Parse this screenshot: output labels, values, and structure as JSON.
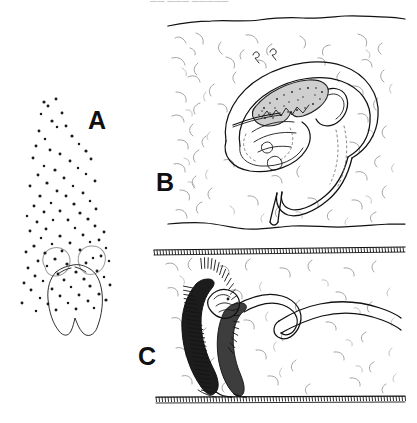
{
  "figure": {
    "type": "scientific-line-drawing",
    "background_color": "#ffffff",
    "ink_color": "#111111",
    "texture_color": "#8d8d8d",
    "width": 417,
    "height": 423,
    "top_caption_truncated": "—— ——— —————"
  },
  "panels": [
    {
      "id": "A",
      "label": "A",
      "label_x": 88,
      "label_y": 108,
      "description": "Stippled outline of a lobed body with a rising plume of scattered dots",
      "has_border": false,
      "dot_count": 78
    },
    {
      "id": "B",
      "label": "B",
      "label_x": 156,
      "label_y": 170,
      "description": "Coiled worm-like organism within textured soil cross-section, stippled internal organ",
      "has_border": false,
      "bounds": {
        "x": 167,
        "y": 16,
        "w": 238,
        "h": 212
      }
    },
    {
      "id": "C",
      "label": "C",
      "label_x": 138,
      "label_y": 344,
      "description": "Darkly shaded organism in a chamber bounded by hatched surfaces top and bottom",
      "has_border": false,
      "bounds": {
        "x": 153,
        "y": 243,
        "w": 252,
        "h": 160
      }
    }
  ],
  "panel_a_dots": [
    [
      44,
      102
    ],
    [
      48,
      106
    ],
    [
      56,
      99
    ],
    [
      41,
      114
    ],
    [
      62,
      113
    ],
    [
      52,
      121
    ],
    [
      57,
      127
    ],
    [
      39,
      131
    ],
    [
      66,
      126
    ],
    [
      45,
      139
    ],
    [
      72,
      136
    ],
    [
      36,
      146
    ],
    [
      79,
      144
    ],
    [
      50,
      150
    ],
    [
      60,
      154
    ],
    [
      86,
      151
    ],
    [
      33,
      158
    ],
    [
      70,
      161
    ],
    [
      44,
      166
    ],
    [
      91,
      159
    ],
    [
      55,
      170
    ],
    [
      78,
      168
    ],
    [
      38,
      175
    ],
    [
      64,
      178
    ],
    [
      86,
      174
    ],
    [
      47,
      183
    ],
    [
      30,
      186
    ],
    [
      73,
      186
    ],
    [
      95,
      181
    ],
    [
      57,
      191
    ],
    [
      40,
      196
    ],
    [
      66,
      196
    ],
    [
      83,
      193
    ],
    [
      51,
      203
    ],
    [
      34,
      206
    ],
    [
      74,
      204
    ],
    [
      90,
      201
    ],
    [
      44,
      212
    ],
    [
      60,
      211
    ],
    [
      27,
      216
    ],
    [
      80,
      213
    ],
    [
      96,
      209
    ],
    [
      53,
      220
    ],
    [
      37,
      222
    ],
    [
      68,
      220
    ],
    [
      88,
      219
    ],
    [
      46,
      229
    ],
    [
      30,
      231
    ],
    [
      75,
      228
    ],
    [
      95,
      226
    ],
    [
      60,
      236
    ],
    [
      41,
      238
    ],
    [
      83,
      235
    ],
    [
      104,
      232
    ],
    [
      52,
      244
    ],
    [
      34,
      246
    ],
    [
      70,
      243
    ],
    [
      90,
      242
    ],
    [
      99,
      240
    ],
    [
      26,
      252
    ],
    [
      45,
      253
    ],
    [
      62,
      251
    ],
    [
      80,
      250
    ],
    [
      106,
      248
    ],
    [
      38,
      261
    ],
    [
      55,
      259
    ],
    [
      93,
      258
    ],
    [
      101,
      256
    ],
    [
      28,
      268
    ],
    [
      47,
      266
    ],
    [
      67,
      264
    ],
    [
      86,
      263
    ],
    [
      109,
      261
    ],
    [
      35,
      276
    ],
    [
      58,
      274
    ],
    [
      76,
      272
    ],
    [
      97,
      271
    ],
    [
      24,
      283
    ],
    [
      43,
      281
    ],
    [
      64,
      280
    ],
    [
      84,
      279
    ],
    [
      104,
      277
    ],
    [
      31,
      290
    ],
    [
      52,
      289
    ],
    [
      71,
      287
    ],
    [
      90,
      286
    ],
    [
      110,
      285
    ],
    [
      40,
      298
    ],
    [
      60,
      296
    ],
    [
      79,
      295
    ],
    [
      99,
      294
    ],
    [
      22,
      303
    ],
    [
      48,
      304
    ],
    [
      68,
      303
    ],
    [
      88,
      301
    ],
    [
      106,
      300
    ],
    [
      36,
      311
    ],
    [
      56,
      310
    ],
    [
      76,
      309
    ],
    [
      94,
      308
    ]
  ],
  "annotations": {
    "panel_a_body": "two-lobed outlined body",
    "panel_b_organism": "coiled nematode / larva",
    "panel_c_organism": "shaded larva in burrow chamber"
  }
}
